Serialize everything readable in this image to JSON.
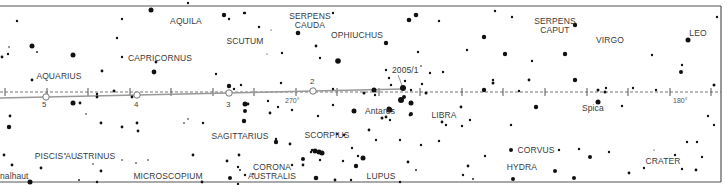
{
  "map": {
    "type": "star-chart",
    "colors": {
      "border": "#555555",
      "star": "#111111",
      "ecliptic": "#777777",
      "comet_path": "#999999",
      "text": "#3a3a3a"
    },
    "constellations": [
      {
        "name": "AQUILA",
        "x": 186,
        "y": 17
      },
      {
        "name": "SERPENS\nCAUDA",
        "x": 310,
        "y": 12
      },
      {
        "name": "SERPENS\nCAPUT",
        "x": 555,
        "y": 17
      },
      {
        "name": "SCUTUM",
        "x": 245,
        "y": 37
      },
      {
        "name": "OPHIUCHUS",
        "x": 357,
        "y": 31
      },
      {
        "name": "VIRGO",
        "x": 610,
        "y": 36
      },
      {
        "name": "LEO",
        "x": 698,
        "y": 29
      },
      {
        "name": "CAPRICORNUS",
        "x": 160,
        "y": 54
      },
      {
        "name": "AQUARIUS",
        "x": 59,
        "y": 72
      },
      {
        "name": "SAGITTARIUS",
        "x": 240,
        "y": 132
      },
      {
        "name": "SCORPIUS",
        "x": 327,
        "y": 131
      },
      {
        "name": "LIBRA",
        "x": 444,
        "y": 111
      },
      {
        "name": "CORVUS",
        "x": 536,
        "y": 146
      },
      {
        "name": "CRATER",
        "x": 663,
        "y": 157
      },
      {
        "name": "HYDRA",
        "x": 522,
        "y": 163
      },
      {
        "name": "PISCIS AUSTRINUS",
        "x": 75,
        "y": 152
      },
      {
        "name": "MICROSCOPIUM",
        "x": 168,
        "y": 172
      },
      {
        "name": "CORONA\nAUSTRALIS",
        "x": 272,
        "y": 163
      },
      {
        "name": "LUPUS",
        "x": 381,
        "y": 172
      }
    ],
    "star_names": [
      {
        "name": "Antares",
        "x": 365,
        "y": 107
      },
      {
        "name": "Spica",
        "x": 582,
        "y": 104
      },
      {
        "name": "nalhaut",
        "x": 12,
        "y": 172
      }
    ],
    "ecliptic": {
      "y": 92,
      "ticks_x": [
        5,
        47,
        88,
        130,
        171,
        213,
        254,
        296,
        337,
        379,
        420,
        462,
        503,
        545,
        587,
        628,
        670,
        711
      ],
      "degree_labels": [
        {
          "text": "270°",
          "x": 285,
          "y": 97
        },
        {
          "text": "180°",
          "x": 673,
          "y": 97
        }
      ]
    },
    "comet": {
      "designation": "2005/1",
      "label_x": 392,
      "label_y": 66,
      "positions": [
        {
          "label": "5",
          "x": 46,
          "y": 97,
          "lx": 42,
          "ly": 101
        },
        {
          "label": "4",
          "x": 137,
          "y": 95,
          "lx": 134,
          "ly": 101
        },
        {
          "label": "3",
          "x": 229,
          "y": 93,
          "lx": 226,
          "ly": 101
        },
        {
          "label": "2",
          "x": 313,
          "y": 91,
          "lx": 310,
          "ly": 78
        }
      ]
    },
    "stars": [
      [
        188,
        3,
        1.2
      ],
      [
        151,
        10,
        2.5
      ],
      [
        17,
        21,
        1.2
      ],
      [
        122,
        19,
        1.2
      ],
      [
        224,
        15,
        2.2
      ],
      [
        229,
        19,
        1.2
      ],
      [
        245,
        13,
        1.2
      ],
      [
        244,
        13,
        1.2
      ],
      [
        259,
        27,
        1.2
      ],
      [
        271,
        30,
        0.6
      ],
      [
        298,
        33,
        2.3
      ],
      [
        333,
        13,
        1.2
      ],
      [
        416,
        15,
        2.3
      ],
      [
        409,
        20,
        2.3
      ],
      [
        439,
        21,
        1.2
      ],
      [
        484,
        37,
        2.2
      ],
      [
        575,
        25,
        2.2
      ],
      [
        688,
        40,
        2.5
      ],
      [
        717,
        17,
        1.2
      ],
      [
        495,
        11,
        1.2
      ],
      [
        512,
        17,
        1.2
      ],
      [
        117,
        38,
        1.2
      ],
      [
        9,
        47,
        0.8
      ],
      [
        32,
        46,
        2.5
      ],
      [
        8,
        54,
        1.2
      ],
      [
        37,
        52,
        0.9
      ],
      [
        73,
        55,
        2.5
      ],
      [
        2,
        57,
        1.4
      ],
      [
        122,
        57,
        1.2
      ],
      [
        156,
        62,
        1.4
      ],
      [
        102,
        71,
        1.4
      ],
      [
        154,
        72,
        2.4
      ],
      [
        216,
        74,
        1.2
      ],
      [
        32,
        80,
        1.4
      ],
      [
        282,
        53,
        1.2
      ],
      [
        316,
        46,
        1.4
      ],
      [
        320,
        58,
        1.2
      ],
      [
        338,
        61,
        2.8
      ],
      [
        267,
        54,
        0.6
      ],
      [
        386,
        43,
        2.2
      ],
      [
        418,
        52,
        1.2
      ],
      [
        421,
        66,
        0.8
      ],
      [
        430,
        73,
        1.2
      ],
      [
        443,
        72,
        1.2
      ],
      [
        467,
        50,
        1.2
      ],
      [
        505,
        54,
        2.2
      ],
      [
        565,
        54,
        2.2
      ],
      [
        532,
        61,
        1.2
      ],
      [
        493,
        80,
        1.2
      ],
      [
        529,
        80,
        1.4
      ],
      [
        575,
        80,
        2.2
      ],
      [
        652,
        55,
        1.2
      ],
      [
        682,
        65,
        1.2
      ],
      [
        681,
        72,
        2
      ],
      [
        633,
        88,
        1.2
      ],
      [
        656,
        90,
        1.2
      ],
      [
        714,
        85,
        1.5
      ],
      [
        386,
        70,
        1.2
      ],
      [
        389,
        78,
        1.2
      ],
      [
        391,
        85,
        1.2
      ],
      [
        403,
        88,
        3
      ],
      [
        411,
        90,
        1.2
      ],
      [
        404,
        97,
        2
      ],
      [
        374,
        90,
        2.5
      ],
      [
        405,
        81,
        1.2
      ],
      [
        422,
        84,
        1.2
      ],
      [
        426,
        93,
        1.5
      ],
      [
        484,
        90,
        2.2
      ],
      [
        519,
        91,
        1.2
      ],
      [
        493,
        83,
        1.5
      ],
      [
        598,
        90,
        1.5
      ],
      [
        605,
        92,
        1.5
      ],
      [
        606,
        88,
        1.2
      ],
      [
        229,
        86,
        2.2
      ],
      [
        234,
        89,
        1.2
      ],
      [
        241,
        85,
        1.2
      ],
      [
        281,
        83,
        1.2
      ],
      [
        333,
        89,
        1.2
      ],
      [
        364,
        93,
        1.5
      ],
      [
        375,
        95,
        1.2
      ],
      [
        97,
        94,
        1.2
      ],
      [
        114,
        91,
        1.4
      ],
      [
        73,
        103,
        2.5
      ],
      [
        80,
        103,
        1.4
      ],
      [
        97,
        97,
        1.4
      ],
      [
        132,
        97,
        1.4
      ],
      [
        245,
        104,
        2.5
      ],
      [
        245,
        111,
        2
      ],
      [
        244,
        121,
        2.2
      ],
      [
        248,
        104,
        1.4
      ],
      [
        268,
        101,
        1.2
      ],
      [
        270,
        113,
        1.4
      ],
      [
        292,
        110,
        1.2
      ],
      [
        278,
        107,
        1.2
      ],
      [
        318,
        116,
        1.2
      ],
      [
        333,
        105,
        1.2
      ],
      [
        354,
        111,
        2.5
      ],
      [
        390,
        110,
        2.5
      ],
      [
        390,
        120,
        1.2
      ],
      [
        401,
        100,
        3
      ],
      [
        389,
        110,
        2.5
      ],
      [
        382,
        118,
        1.5
      ],
      [
        410,
        115,
        1.4
      ],
      [
        411,
        103,
        2.5
      ],
      [
        411,
        114,
        2
      ],
      [
        386,
        117,
        1.4
      ],
      [
        389,
        109,
        2.5
      ],
      [
        442,
        122,
        1.4
      ],
      [
        461,
        107,
        1.4
      ],
      [
        470,
        120,
        1.2
      ],
      [
        462,
        126,
        1.2
      ],
      [
        446,
        125,
        1.2
      ],
      [
        511,
        125,
        1.2
      ],
      [
        536,
        107,
        2.2
      ],
      [
        598,
        102,
        2.5
      ],
      [
        622,
        106,
        1.2
      ],
      [
        708,
        116,
        1.2
      ],
      [
        714,
        125,
        1.2
      ],
      [
        687,
        142,
        1.2
      ],
      [
        10,
        116,
        1.4
      ],
      [
        9,
        127,
        2.2
      ],
      [
        86,
        114,
        0.8
      ],
      [
        101,
        123,
        1.4
      ],
      [
        122,
        127,
        1.4
      ],
      [
        137,
        123,
        1.4
      ],
      [
        138,
        131,
        1.4
      ],
      [
        184,
        123,
        0.8
      ],
      [
        188,
        119,
        0.8
      ],
      [
        203,
        123,
        1.2
      ],
      [
        276,
        139,
        1.2
      ],
      [
        276,
        142,
        2.2
      ],
      [
        290,
        144,
        1.4
      ],
      [
        312,
        150,
        1.2
      ],
      [
        311,
        152,
        1.2
      ],
      [
        303,
        159,
        2
      ],
      [
        303,
        165,
        1.4
      ],
      [
        292,
        165,
        1.2
      ],
      [
        320,
        160,
        1.2
      ],
      [
        319,
        152,
        2.5
      ],
      [
        315,
        151,
        2.5
      ],
      [
        322,
        153,
        2.5
      ],
      [
        337,
        134,
        1.2
      ],
      [
        344,
        135,
        1.2
      ],
      [
        369,
        130,
        1.4
      ],
      [
        376,
        140,
        1.2
      ],
      [
        363,
        158,
        2.5
      ],
      [
        352,
        148,
        1.2
      ],
      [
        358,
        156,
        1.2
      ],
      [
        343,
        161,
        1.2
      ],
      [
        356,
        166,
        2.2
      ],
      [
        400,
        140,
        1.2
      ],
      [
        421,
        145,
        1.2
      ],
      [
        439,
        141,
        1.2
      ],
      [
        468,
        166,
        1.4
      ],
      [
        485,
        156,
        1.2
      ],
      [
        511,
        150,
        2
      ],
      [
        559,
        150,
        1.2
      ],
      [
        579,
        149,
        1.2
      ],
      [
        590,
        157,
        2
      ],
      [
        609,
        152,
        1.2
      ],
      [
        654,
        150,
        0.6
      ],
      [
        682,
        169,
        1.2
      ],
      [
        702,
        157,
        1.2
      ],
      [
        697,
        142,
        1.2
      ],
      [
        4,
        155,
        1.4
      ],
      [
        12,
        165,
        1.4
      ],
      [
        41,
        168,
        1.4
      ],
      [
        65,
        154,
        0.8
      ],
      [
        78,
        158,
        0.8
      ],
      [
        93,
        164,
        0.8
      ],
      [
        101,
        171,
        1.4
      ],
      [
        122,
        160,
        0.8
      ],
      [
        136,
        163,
        0.8
      ],
      [
        148,
        160,
        0.8
      ],
      [
        193,
        155,
        1.4
      ],
      [
        227,
        161,
        1.4
      ],
      [
        239,
        155,
        1.4
      ],
      [
        238,
        167,
        1.2
      ],
      [
        240,
        170,
        0.9
      ],
      [
        245,
        175,
        1.2
      ],
      [
        253,
        174,
        0.9
      ],
      [
        230,
        178,
        2
      ],
      [
        79,
        180,
        0.9
      ],
      [
        97,
        182,
        1.2
      ],
      [
        316,
        178,
        2.3
      ],
      [
        335,
        180,
        1.4
      ],
      [
        351,
        180,
        1.2
      ],
      [
        408,
        162,
        1.4
      ],
      [
        416,
        170,
        0.9
      ],
      [
        463,
        175,
        1.2
      ],
      [
        473,
        179,
        0.9
      ],
      [
        513,
        179,
        2
      ],
      [
        555,
        171,
        2
      ],
      [
        574,
        178,
        2
      ],
      [
        629,
        173,
        1.4
      ],
      [
        644,
        168,
        1.2
      ],
      [
        675,
        155,
        1.2
      ],
      [
        696,
        170,
        1.4
      ],
      [
        30,
        182,
        2.5
      ],
      [
        202,
        182,
        1.4
      ],
      [
        238,
        184,
        1.2
      ],
      [
        400,
        182,
        1.2
      ]
    ]
  }
}
